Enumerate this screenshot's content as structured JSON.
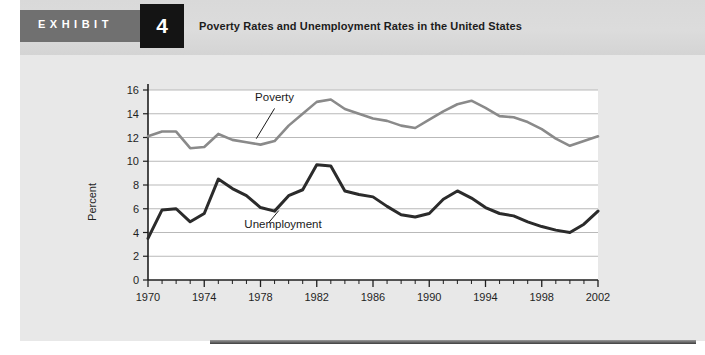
{
  "header": {
    "exhibit_word": "EXHIBIT",
    "exhibit_number": "4",
    "title": "Poverty Rates and Unemployment Rates in the United States"
  },
  "colors": {
    "page_background": "#e8e8e8",
    "header_band": "#d9d9d9",
    "exhibit_tab": "#707070",
    "exhibit_number_box": "#141414",
    "plot_background": "#ffffff",
    "gridline": "#b9b9b9",
    "axis": "#1f1f1f",
    "poverty_line": "#8a8a8a",
    "unemployment_line": "#2b2b2b",
    "bottom_rule": "#5d5d5d"
  },
  "chart_data": {
    "type": "line",
    "title": "Poverty Rates and Unemployment Rates in the United States",
    "xlabel": "",
    "ylabel": "Percent",
    "xlim": [
      1970,
      2002
    ],
    "ylim": [
      0,
      16
    ],
    "yticks": [
      0,
      2,
      4,
      6,
      8,
      10,
      12,
      14,
      16
    ],
    "ytick_labels": [
      "0",
      "2",
      "4",
      "6",
      "8",
      "10",
      "12",
      "14",
      "16"
    ],
    "xticks": [
      1970,
      1974,
      1978,
      1982,
      1986,
      1990,
      1994,
      1998,
      2002
    ],
    "xtick_labels": [
      "1970",
      "1974",
      "1978",
      "1982",
      "1986",
      "1990",
      "1994",
      "1998",
      "2002"
    ],
    "minor_xtick_step": 1,
    "grid": "horizontal",
    "legend": "inline-annotations",
    "x": [
      1970,
      1971,
      1972,
      1973,
      1974,
      1975,
      1976,
      1977,
      1978,
      1979,
      1980,
      1981,
      1982,
      1983,
      1984,
      1985,
      1986,
      1987,
      1988,
      1989,
      1990,
      1991,
      1992,
      1993,
      1994,
      1995,
      1996,
      1997,
      1998,
      1999,
      2000,
      2001,
      2002
    ],
    "series": [
      {
        "name": "Poverty",
        "color": "#8a8a8a",
        "width": 2.6,
        "annotation": {
          "label": "Poverty",
          "text_x": 1979.0,
          "text_y": 15.05,
          "leader_from_x": 1979.0,
          "leader_from_y": 14.45,
          "leader_to_x": 1977.7,
          "leader_to_y": 11.9
        },
        "values": [
          12.1,
          12.5,
          12.5,
          11.1,
          11.2,
          12.3,
          11.8,
          11.6,
          11.4,
          11.7,
          13.0,
          14.0,
          15.0,
          15.2,
          14.4,
          14.0,
          13.6,
          13.4,
          13.0,
          12.8,
          13.5,
          14.2,
          14.8,
          15.1,
          14.5,
          13.8,
          13.7,
          13.3,
          12.7,
          11.9,
          11.3,
          11.7,
          12.1
        ]
      },
      {
        "name": "Unemployment",
        "color": "#2b2b2b",
        "width": 3.0,
        "annotation": {
          "label": "Unemployment",
          "text_x": 1979.6,
          "text_y": 4.35,
          "leader_from_x": 1978.6,
          "leader_from_y": 4.85,
          "leader_to_x": 1979.3,
          "leader_to_y": 5.85
        },
        "values": [
          3.5,
          5.9,
          6.0,
          4.9,
          5.6,
          8.5,
          7.7,
          7.1,
          6.1,
          5.8,
          7.1,
          7.6,
          9.7,
          9.6,
          7.5,
          7.2,
          7.0,
          6.2,
          5.5,
          5.3,
          5.6,
          6.8,
          7.5,
          6.9,
          6.1,
          5.6,
          5.4,
          4.9,
          4.5,
          4.2,
          4.0,
          4.7,
          5.8
        ]
      }
    ]
  }
}
